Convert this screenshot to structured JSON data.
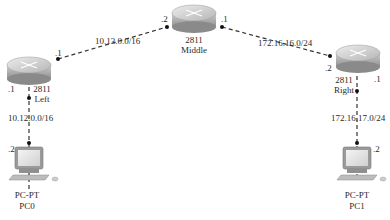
{
  "diagram": {
    "routers": [
      {
        "id": "left",
        "model": "2811",
        "name": "Left"
      },
      {
        "id": "middle",
        "model": "2811",
        "name": "Middle"
      },
      {
        "id": "right",
        "model": "2811",
        "name": "Right"
      }
    ],
    "pcs": [
      {
        "id": "pc0",
        "type": "PC-PT",
        "name": "PC0"
      },
      {
        "id": "pc1",
        "type": "PC-PT",
        "name": "PC1"
      }
    ],
    "links": [
      {
        "from": "left",
        "to": "middle",
        "network": "10.13.0.0/16",
        "from_host": ".1",
        "to_host": ".2"
      },
      {
        "from": "middle",
        "to": "right",
        "network": "172.16.16.0/24",
        "from_host": ".1",
        "to_host": ".2"
      },
      {
        "from": "left",
        "to": "pc0",
        "network": "10.12.0.0/16",
        "from_host": ".1",
        "to_host": ".2"
      },
      {
        "from": "right",
        "to": "pc1",
        "network": "172.16.17.0/24",
        "from_host": ".1",
        "to_host": ".2"
      }
    ],
    "colors": {
      "link": "#333333",
      "router_body": "#b9b9b9",
      "router_top": "#d8d8d8"
    }
  }
}
